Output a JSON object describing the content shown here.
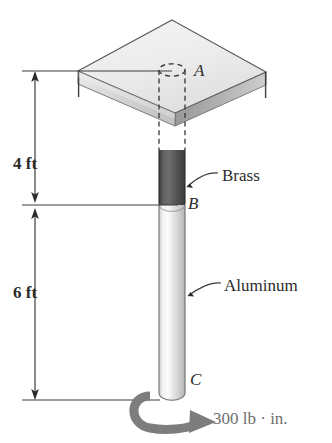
{
  "figure": {
    "background_color": "#ffffff",
    "ink_color": "#2b2b2b"
  },
  "points": [
    {
      "name": "point-a",
      "label": "A",
      "x": 194,
      "y": 64,
      "description": "top of rod at fixed support plate"
    },
    {
      "name": "point-b",
      "label": "B",
      "x": 188,
      "y": 196,
      "description": "junction between brass and aluminum segments"
    },
    {
      "name": "point-c",
      "label": "C",
      "x": 190,
      "y": 372,
      "description": "free end of rod where torque is applied"
    }
  ],
  "materials": [
    {
      "name": "brass-segment",
      "label": "Brass",
      "color": "#4f4f4f",
      "label_x": 222,
      "label_y": 168,
      "leader": {
        "x1": 213,
        "y1": 174,
        "x2": 186,
        "y2": 188
      }
    },
    {
      "name": "aluminum-segment",
      "label": "Aluminum",
      "color": "#d9d9d9",
      "label_x": 224,
      "label_y": 278,
      "leader": {
        "x1": 216,
        "y1": 284,
        "x2": 186,
        "y2": 296
      }
    }
  ],
  "dimensions": [
    {
      "name": "dimension-4ft",
      "label": "4 ft",
      "value": 4,
      "unit": "ft",
      "label_x": 13,
      "label_y": 156,
      "line_x": 35,
      "y_top": 71,
      "y_bottom": 203
    },
    {
      "name": "dimension-6ft",
      "label": "6 ft",
      "value": 6,
      "unit": "ft",
      "label_x": 13,
      "label_y": 285,
      "line_x": 35,
      "y_top": 208,
      "y_bottom": 400
    }
  ],
  "load": {
    "name": "applied-torque",
    "label": "300 lb · in.",
    "magnitude": 300,
    "unit": "lb · in.",
    "label_x": 213,
    "label_y": 411,
    "arrow_color": "#7d7d7d",
    "direction": "clockwise-viewed-from-below"
  },
  "plate": {
    "name": "support-plate",
    "apex": {
      "x": 172,
      "y": 20
    },
    "left": {
      "x": 78,
      "y": 71
    },
    "right": {
      "x": 266,
      "y": 72
    },
    "front": {
      "x": 175,
      "y": 113
    },
    "thickness": 13,
    "top_face_color": "#ededed",
    "left_face_color": "#d6d6d6",
    "right_face_color": "#b6b6b6"
  },
  "rod": {
    "name": "stepped-rod",
    "x_left": 159,
    "x_right": 185,
    "hidden_top_y": 64,
    "brass_top_y": 148,
    "brass_bottom_y": 207,
    "bottom_y": 400
  }
}
